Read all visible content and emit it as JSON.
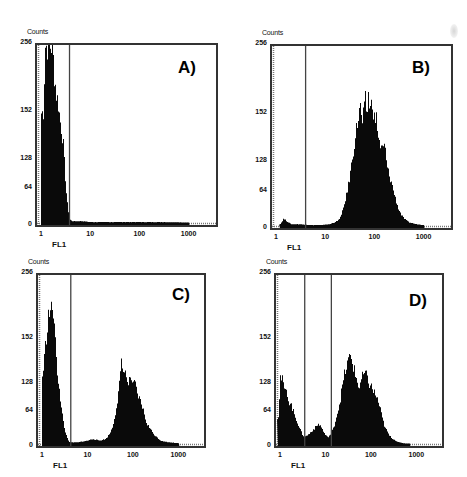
{
  "figure": {
    "y_axis_label": "Counts",
    "x_axis_label": "FL1",
    "y_ticks": [
      "256",
      "152",
      "128",
      "64",
      "0"
    ],
    "x_ticks": [
      "1",
      "10",
      "100",
      "1000"
    ],
    "colors": {
      "bars": "#0a0a0a",
      "frame": "#333333",
      "gate": "#444444",
      "background": "#ffffff"
    }
  },
  "panels": [
    {
      "id": "A",
      "letter": "A)",
      "frame": {
        "left": 35,
        "top": 43,
        "width": 183,
        "height": 184
      },
      "ylabels_top": 42,
      "xtick_y": 230,
      "xlabel_y": 240,
      "gates_decades": [
        0.58
      ],
      "letter_pos": {
        "left": 178,
        "top": 58
      }
    },
    {
      "id": "B",
      "letter": "B)",
      "frame": {
        "left": 270,
        "top": 44,
        "width": 183,
        "height": 186
      },
      "ylabels_top": 43,
      "xtick_y": 233,
      "xlabel_y": 243,
      "gates_decades": [
        0.6
      ],
      "letter_pos": {
        "left": 412,
        "top": 58
      }
    },
    {
      "id": "C",
      "letter": "C)",
      "frame": {
        "left": 36,
        "top": 273,
        "width": 170,
        "height": 175
      },
      "ylabels_top": 272,
      "xtick_y": 451,
      "xlabel_y": 461,
      "gates_decades": [
        0.63
      ],
      "letter_pos": {
        "left": 172,
        "top": 285
      }
    },
    {
      "id": "D",
      "letter": "D)",
      "frame": {
        "left": 274,
        "top": 273,
        "width": 170,
        "height": 175
      },
      "ylabels_top": 272,
      "xtick_y": 451,
      "xlabel_y": 461,
      "gates_decades": [
        0.55,
        1.13
      ],
      "letter_pos": {
        "left": 409,
        "top": 291
      }
    }
  ],
  "chart_data": [
    {
      "type": "bar",
      "title": "A)",
      "xlabel": "FL1",
      "ylabel": "Counts",
      "xscale": "log",
      "xlim": [
        1,
        3000
      ],
      "y_tick_labels": [
        "0",
        "64",
        "128",
        "152",
        "256"
      ],
      "grid": false,
      "legend": null,
      "gates_FL1": [
        3.8
      ],
      "x": [
        1.0,
        1.1,
        1.2,
        1.3,
        1.4,
        1.5,
        1.6,
        1.7,
        1.8,
        1.9,
        2.0,
        2.2,
        2.4,
        2.6,
        2.8,
        3.0,
        3.2,
        3.4,
        3.6,
        3.8,
        4.2,
        5,
        7,
        10,
        20,
        50,
        100,
        300,
        1000
      ],
      "y_fraction": [
        0.62,
        0.63,
        1.0,
        1.0,
        1.0,
        1.0,
        1.0,
        1.0,
        0.86,
        0.8,
        0.73,
        0.68,
        0.58,
        0.52,
        0.44,
        0.3,
        0.18,
        0.1,
        0.05,
        0.02,
        0.01,
        0.01,
        0.01,
        0.005,
        0.005,
        0.005,
        0.005,
        0.005,
        0.003
      ],
      "notes": "Single negative peak saturating at 256 counts near FL1 1-1.8"
    },
    {
      "type": "bar",
      "title": "B)",
      "xlabel": "FL1",
      "ylabel": "Counts",
      "xscale": "log",
      "xlim": [
        1,
        3000
      ],
      "y_tick_labels": [
        "0",
        "64",
        "128",
        "152",
        "256"
      ],
      "grid": false,
      "legend": null,
      "gates_FL1": [
        4.0
      ],
      "x": [
        1.2,
        1.4,
        2,
        3,
        5,
        8,
        12,
        15,
        18,
        21,
        24,
        28,
        32,
        36,
        40,
        45,
        50,
        55,
        60,
        65,
        70,
        75,
        80,
        90,
        100,
        110,
        120,
        140,
        160,
        180,
        200,
        230,
        260,
        300,
        350,
        400,
        500,
        700,
        1000
      ],
      "y_fraction": [
        0.01,
        0.04,
        0.01,
        0.01,
        0.005,
        0.005,
        0.01,
        0.02,
        0.03,
        0.06,
        0.12,
        0.2,
        0.3,
        0.4,
        0.5,
        0.58,
        0.68,
        0.57,
        0.62,
        0.7,
        0.62,
        0.75,
        0.64,
        0.7,
        0.58,
        0.6,
        0.48,
        0.42,
        0.45,
        0.32,
        0.28,
        0.22,
        0.16,
        0.1,
        0.06,
        0.04,
        0.02,
        0.01,
        0.005
      ],
      "notes": "Single positive peak, modal ~FL1 80, max ~152+ counts"
    },
    {
      "type": "bar",
      "title": "C)",
      "xlabel": "FL1",
      "ylabel": "Counts",
      "xscale": "log",
      "xlim": [
        1,
        3000
      ],
      "y_tick_labels": [
        "0",
        "64",
        "128",
        "152",
        "256"
      ],
      "grid": false,
      "legend": null,
      "gates_FL1": [
        4.3
      ],
      "x": [
        1.0,
        1.1,
        1.2,
        1.3,
        1.4,
        1.5,
        1.6,
        1.7,
        1.8,
        1.9,
        2.0,
        2.2,
        2.4,
        2.6,
        2.8,
        3.0,
        3.3,
        3.6,
        4,
        6,
        10,
        13,
        18,
        25,
        30,
        35,
        40,
        45,
        50,
        55,
        60,
        65,
        70,
        80,
        90,
        100,
        110,
        120,
        140,
        160,
        180,
        200,
        250,
        300,
        400,
        600,
        1000
      ],
      "y_fraction": [
        0.4,
        0.5,
        0.62,
        0.72,
        0.78,
        0.8,
        0.78,
        0.82,
        0.76,
        0.62,
        0.52,
        0.4,
        0.32,
        0.22,
        0.16,
        0.1,
        0.06,
        0.03,
        0.01,
        0.01,
        0.02,
        0.03,
        0.02,
        0.03,
        0.06,
        0.1,
        0.18,
        0.26,
        0.36,
        0.48,
        0.42,
        0.48,
        0.38,
        0.36,
        0.4,
        0.34,
        0.36,
        0.3,
        0.26,
        0.22,
        0.16,
        0.12,
        0.08,
        0.05,
        0.02,
        0.01,
        0.005
      ],
      "notes": "Bimodal: negative peak ~FL1 1.5 (~152 counts), positive peak ~FL1 60-100 (~90 counts)"
    },
    {
      "type": "bar",
      "title": "D)",
      "xlabel": "FL1",
      "ylabel": "Counts",
      "xscale": "log",
      "xlim": [
        1,
        3000
      ],
      "y_tick_labels": [
        "0",
        "64",
        "128",
        "152",
        "256"
      ],
      "grid": false,
      "legend": null,
      "gates_FL1": [
        3.5,
        13.5
      ],
      "x": [
        0.9,
        1.0,
        1.1,
        1.2,
        1.3,
        1.4,
        1.5,
        1.7,
        2.0,
        2.3,
        2.6,
        3.0,
        3.4,
        3.8,
        4.3,
        5,
        6,
        7,
        8,
        9,
        10,
        11,
        12,
        13,
        15,
        17,
        20,
        23,
        26,
        30,
        34,
        38,
        42,
        46,
        50,
        55,
        60,
        70,
        80,
        90,
        100,
        120,
        140,
        160,
        180,
        200,
        250,
        300,
        400,
        500,
        700
      ],
      "y_fraction": [
        0.16,
        0.4,
        0.38,
        0.34,
        0.3,
        0.32,
        0.26,
        0.24,
        0.18,
        0.14,
        0.1,
        0.06,
        0.04,
        0.05,
        0.06,
        0.08,
        0.1,
        0.12,
        0.1,
        0.07,
        0.05,
        0.04,
        0.05,
        0.06,
        0.1,
        0.16,
        0.24,
        0.34,
        0.42,
        0.48,
        0.52,
        0.5,
        0.44,
        0.4,
        0.36,
        0.34,
        0.38,
        0.42,
        0.4,
        0.36,
        0.34,
        0.3,
        0.26,
        0.2,
        0.14,
        0.1,
        0.05,
        0.03,
        0.01,
        0.005,
        0.002
      ],
      "notes": "Trimodal: negative peak ~FL1 1 (~110 counts), small intermediate peak ~FL1 7 (~35 counts), positive peak ~FL1 40 (~140 counts)"
    }
  ]
}
